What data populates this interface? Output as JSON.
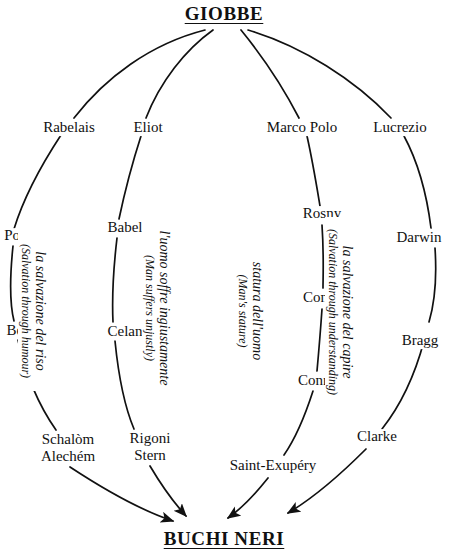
{
  "figure": {
    "top_title": "GIOBBE",
    "bottom_title": "BUCHI NERI"
  },
  "branches": [
    {
      "id": "humour",
      "caption_main": "la salvazione del riso",
      "caption_sub": "(Salvation through humour)",
      "nodes": [
        "Rabelais",
        "Porta",
        "Belli",
        "Schalòm\nAlechém"
      ]
    },
    {
      "id": "unjustly",
      "caption_main": "l'uomo soffre ingiustamente",
      "caption_sub": "(Man suffers unjustly)",
      "nodes": [
        "Eliot",
        "Babel",
        "Celan",
        "Rigoni\nStern"
      ]
    },
    {
      "id": "stature",
      "caption_main": "statura dell'uomo",
      "caption_sub": "(Man's stature)",
      "nodes": [
        "Marco Polo",
        "Rosny",
        "Conrad",
        "Conrad",
        "Saint-Exupéry"
      ]
    },
    {
      "id": "understanding",
      "caption_main": "la salvazione del capire",
      "caption_sub": "(Salvation through understanding)",
      "nodes": [
        "Lucrezio",
        "Darwin",
        "Bragg",
        "Clarke"
      ]
    }
  ],
  "labels": {
    "rabelais": "Rabelais",
    "porta": "Porta",
    "belli": "Belli",
    "schalom_line1": "Schalòm",
    "schalom_line2": "Alechém",
    "eliot": "Eliot",
    "babel": "Babel",
    "celan": "Celan",
    "rigoni_line1": "Rigoni",
    "rigoni_line2": "Stern",
    "marco_polo": "Marco Polo",
    "rosny": "Rosny",
    "conrad_upper": "Conrad",
    "conrad_lower": "Conrad",
    "saint_exupery": "Saint-Exupéry",
    "lucrezio": "Lucrezio",
    "darwin": "Darwin",
    "bragg": "Bragg",
    "clarke": "Clarke"
  },
  "captions": {
    "humour_main": "la salvazione del riso",
    "humour_sub": "(Salvation through humour)",
    "unjustly_main": "l'uomo soffre ingiustamente",
    "unjustly_sub": "(Man suffers unjustly)",
    "stature_main": "statura dell'uomo",
    "stature_sub": "(Man's stature)",
    "understanding_main": "la salvazione del capire",
    "understanding_sub": "(Salvation through understanding)"
  },
  "colors": {
    "ink": "#111111",
    "background": "#ffffff"
  }
}
